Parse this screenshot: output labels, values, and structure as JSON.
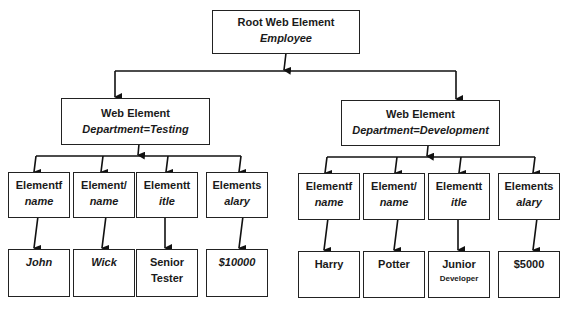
{
  "root": {
    "title": "Root Web Element",
    "subtitle": "Employee"
  },
  "departments": [
    {
      "title": "Web Element",
      "subtitle": "Department=Testing",
      "fields": [
        {
          "label": "Elementf",
          "sub": "name",
          "value": "John",
          "value_italic": true
        },
        {
          "label": "Element/",
          "sub": "name",
          "value": "Wick",
          "value_italic": true
        },
        {
          "label": "Elementt",
          "sub": "itle",
          "value_line1": "Senior",
          "value_line2": "Tester"
        },
        {
          "label": "Elements",
          "sub": "alary",
          "value": "$10000",
          "value_italic": true
        }
      ]
    },
    {
      "title": "Web Element",
      "subtitle": "Department=Development",
      "fields": [
        {
          "label": "Elementf",
          "sub": "name",
          "value": "Harry"
        },
        {
          "label": "Element/",
          "sub": "name",
          "value": "Potter"
        },
        {
          "label": "Elementt",
          "sub": "itle",
          "value_line1": "Junior",
          "value_line2": "Developer"
        },
        {
          "label": "Elements",
          "sub": "alary",
          "value": "$5000"
        }
      ]
    }
  ]
}
